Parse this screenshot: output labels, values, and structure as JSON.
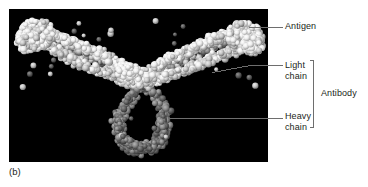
{
  "figure": {
    "caption": "(b)",
    "panel": {
      "background_color": "#000000",
      "subject": "space-filling molecular model of an antibody bound to antigen",
      "structure_note": "Y-shaped immunoglobulin viewed with two Fab arms angled upward and Fc stem pointing down"
    },
    "labels": {
      "antigen": "Antigen",
      "light_chain": "Light\nchain",
      "heavy_chain": "Heavy\nchain",
      "antibody": "Antibody"
    },
    "colors": {
      "text": "#231f20",
      "leader_line": "#6e6e6e",
      "bracket": "#6e6e6e",
      "antigen_spheres": "#f2f2f2",
      "light_chain_spheres": "#c9c9c9",
      "heavy_chain_spheres": "#7a7a7a",
      "panel_background": "#000000"
    }
  }
}
